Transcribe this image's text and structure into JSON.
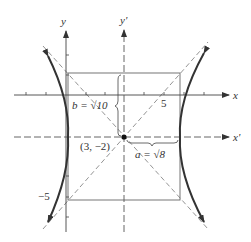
{
  "figure": {
    "type": "hyperbola",
    "axes": {
      "x_label": "x",
      "y_label": "y",
      "x_prime_label": "x'",
      "y_prime_label": "y'"
    },
    "tick_labels": {
      "x_five": "5",
      "y_neg_five": "−5"
    },
    "center_label": "(3, −2)",
    "b_label": "b = √10",
    "a_label": "a = √8",
    "colors": {
      "curve": "#333333",
      "axis": "#444444",
      "asymptote": "#888888",
      "box": "#666666"
    }
  }
}
